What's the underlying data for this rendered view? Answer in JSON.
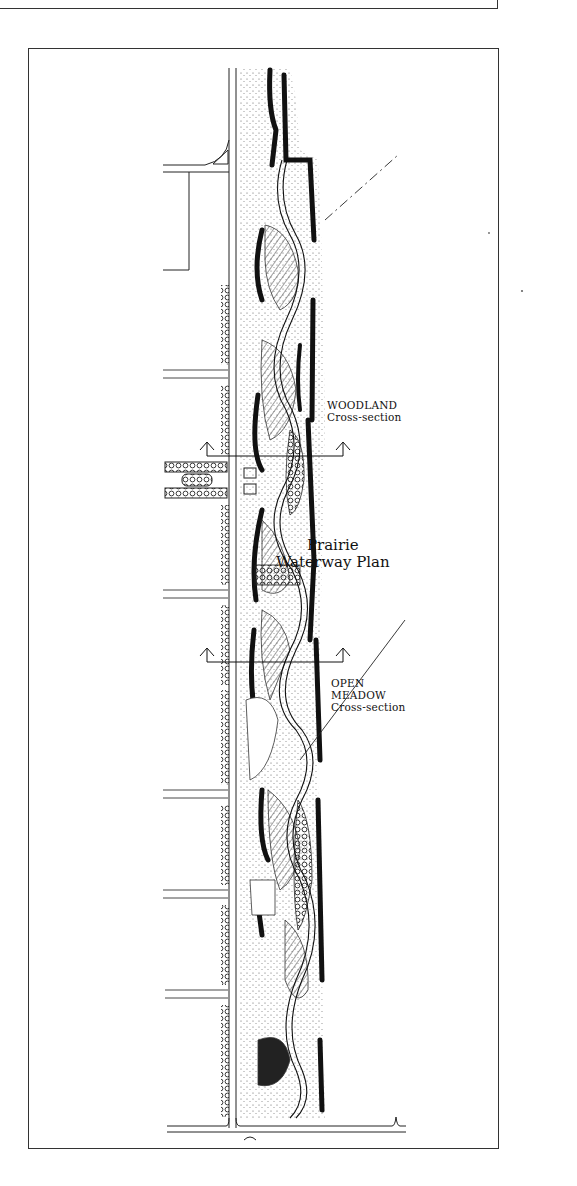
{
  "figure": {
    "title_line1": "Prairie",
    "title_line2": "Waterway Plan"
  },
  "annotations": {
    "woodland": {
      "line1": "WOODLAND",
      "line2": "Cross-section"
    },
    "open_meadow": {
      "line1": "OPEN",
      "line2": "MEADOW",
      "line3": "Cross-section"
    }
  },
  "section_markers": [
    {
      "name": "woodland-section-cut",
      "y": 456,
      "x_start": 207,
      "x_end": 343
    },
    {
      "name": "open-meadow-section-cut",
      "y": 662,
      "x_start": 207,
      "x_end": 343
    }
  ],
  "colors": {
    "ink": "#111111",
    "frame": "#333333",
    "paper": "#ffffff",
    "hatch": "#555555"
  }
}
